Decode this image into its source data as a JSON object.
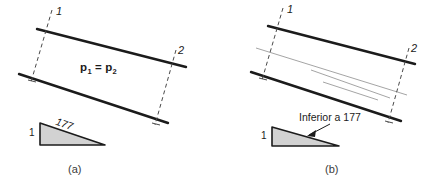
{
  "figure": {
    "stroke_color": "#1b1b1b",
    "thin_stroke_color": "#8a8a8a",
    "triangle_fill": "#d2d2d2",
    "background": "#ffffff"
  },
  "panels": [
    {
      "id": "a",
      "caption": "(a)",
      "endpoint_labels": {
        "start": "1",
        "end": "2"
      },
      "formula": {
        "symbol": "p",
        "sub_left": "1",
        "equals": "=",
        "sub_right": "2",
        "full_text": "p1 = p2"
      },
      "triangle": {
        "leg_label": "1",
        "hypotenuse_label": "177",
        "fill": "#d2d2d2"
      }
    },
    {
      "id": "b",
      "caption": "(b)",
      "endpoint_labels": {
        "start": "1",
        "end": "2"
      },
      "callout": {
        "text": "Inferior a 177"
      },
      "triangle": {
        "leg_label": "1",
        "fill": "#d2d2d2"
      }
    }
  ]
}
